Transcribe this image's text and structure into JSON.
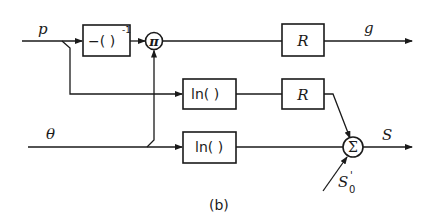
{
  "diagram": {
    "caption": "(b)",
    "inputs": {
      "p": "p",
      "theta": "θ",
      "s0_prime": "S",
      "s0_sub": "0",
      "s0_sup": "'"
    },
    "outputs": {
      "g": "g",
      "s": "S"
    },
    "blocks": {
      "inverse_neg": "−(   )",
      "inverse_exp": "-1",
      "multiply": "π",
      "r_top": "R",
      "ln_mid": "ln(   )",
      "r_mid": "R",
      "ln_bottom": "ln(   )",
      "sum": "Σ"
    },
    "colors": {
      "ink": "#1a1a1a",
      "background": "#ffffff"
    }
  }
}
